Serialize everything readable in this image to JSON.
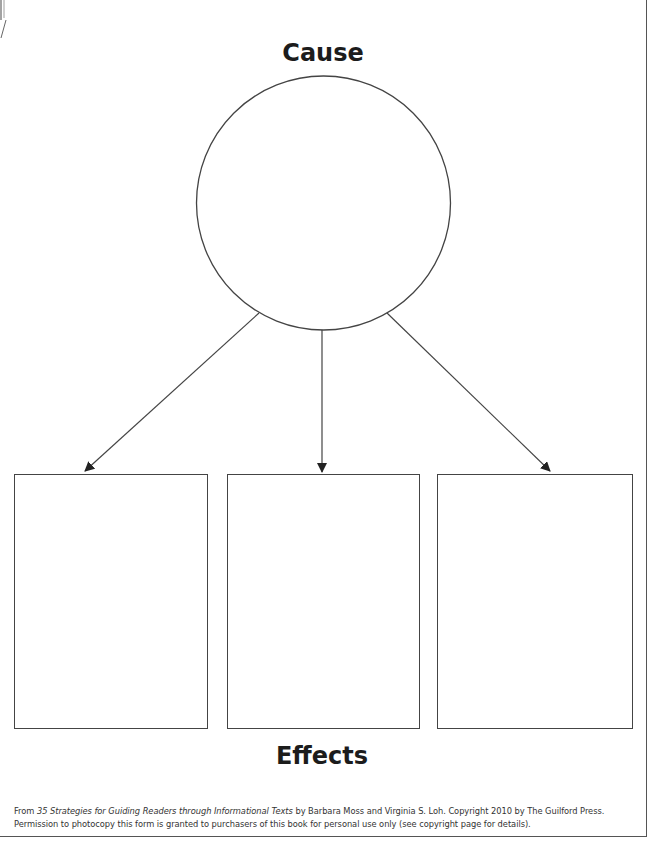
{
  "diagram": {
    "cause_label": "Cause",
    "effects_label": "Effects",
    "effect_boxes": [
      {
        "label": ""
      },
      {
        "label": ""
      },
      {
        "label": ""
      }
    ],
    "colors": {
      "stroke": "#444444",
      "text": "#1c1c1c"
    }
  },
  "footer": {
    "prefix": "From ",
    "book_title": "35 Strategies for Guiding Readers through Informational Texts",
    "suffix": " by Barbara Moss and Virginia S. Loh. Copyright 2010 by The Guilford Press. Permission to photocopy this form is granted to purchasers of this book for personal use only (see copyright page for details)."
  }
}
